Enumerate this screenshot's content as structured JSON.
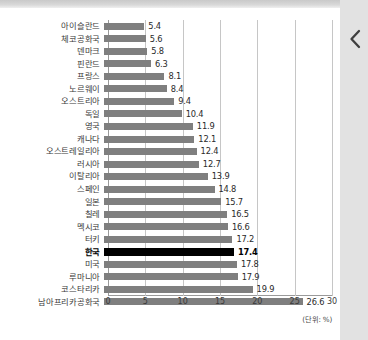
{
  "window": {
    "nav_back_icon": "chevron-left-icon"
  },
  "chart_data": {
    "type": "bar",
    "orientation": "horizontal",
    "title": "",
    "subtitle": "",
    "xlabel": "",
    "ylabel": "",
    "unit_note": "(단위: %)",
    "xlim": [
      0,
      30
    ],
    "xticks": [
      0,
      5,
      10,
      15,
      20,
      25,
      30
    ],
    "xtick_labels": [
      "0",
      "5",
      "10",
      "15",
      "20",
      "25",
      "30"
    ],
    "grid": true,
    "legend": false,
    "highlight_category": "한국",
    "bar_color": "#7f7f7f",
    "highlight_color": "#000000",
    "categories": [
      "아이슬란드",
      "체코공화국",
      "덴마크",
      "핀란드",
      "프랑스",
      "노르웨이",
      "오스트리아",
      "독일",
      "영국",
      "캐나다",
      "오스트레일리아",
      "러시아",
      "이탈리아",
      "스페인",
      "일본",
      "칠레",
      "멕시코",
      "터키",
      "한국",
      "미국",
      "루마니아",
      "코스타리카",
      "남아프리카공화국"
    ],
    "values": [
      5.4,
      5.6,
      5.8,
      6.3,
      8.1,
      8.4,
      9.4,
      10.4,
      11.9,
      12.1,
      12.4,
      12.7,
      13.9,
      14.8,
      15.7,
      16.5,
      16.6,
      17.2,
      17.4,
      17.8,
      17.9,
      19.9,
      26.6
    ],
    "value_labels": [
      "5.4",
      "5.6",
      "5.8",
      "6.3",
      "8.1",
      "8.4",
      "9.4",
      "10.4",
      "11.9",
      "12.1",
      "12.4",
      "12.7",
      "13.9",
      "14.8",
      "15.7",
      "16.5",
      "16.6",
      "17.2",
      "17.4",
      "17.8",
      "17.9",
      "19.9",
      "26.6"
    ]
  }
}
